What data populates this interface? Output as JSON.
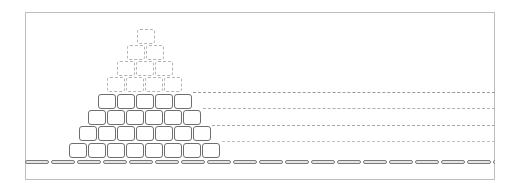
{
  "diagram": {
    "type": "block-pyramid",
    "frame": {
      "border_color": "#bdbdbd"
    },
    "rows": [
      {
        "level": 1,
        "count": 1,
        "style": "faint",
        "top": 29,
        "left": 137
      },
      {
        "level": 2,
        "count": 2,
        "style": "faint",
        "top": 45,
        "left": 127
      },
      {
        "level": 3,
        "count": 3,
        "style": "faint",
        "top": 61,
        "left": 117
      },
      {
        "level": 4,
        "count": 4,
        "style": "faint",
        "top": 77,
        "left": 107
      },
      {
        "level": 5,
        "count": 5,
        "style": "solid",
        "top": 94,
        "left": 98
      },
      {
        "level": 6,
        "count": 6,
        "style": "solid",
        "top": 110,
        "left": 88
      },
      {
        "level": 7,
        "count": 7,
        "style": "solid",
        "top": 126,
        "left": 79
      },
      {
        "level": 8,
        "count": 8,
        "style": "solid",
        "top": 143,
        "left": 69
      }
    ],
    "block": {
      "width": 18,
      "height": 15,
      "pitch": 19,
      "solid_color": "#6e6e6e",
      "faint_color": "#b4b4b4"
    },
    "guides": [
      {
        "y": 92,
        "x_start": 193,
        "x_end": 495,
        "color": "#9a9a9a"
      },
      {
        "y": 108,
        "x_start": 203,
        "x_end": 495,
        "color": "#b0b0b0"
      },
      {
        "y": 125,
        "x_start": 212,
        "x_end": 495,
        "color": "#a8a8a8"
      },
      {
        "y": 141,
        "x_start": 222,
        "x_end": 495,
        "color": "#c0c0c0"
      }
    ],
    "track": {
      "segment_length": 24,
      "gap": 2,
      "color": "#7a7a7a"
    }
  }
}
